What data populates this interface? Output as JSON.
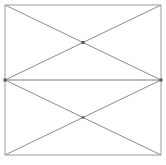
{
  "canvas": {
    "width": 166,
    "height": 165,
    "background_color": "#ffffff",
    "title": ""
  },
  "figure": {
    "name": "crossed-rectangles-diagram",
    "stroke_color": "#8c8c8c",
    "divider_color": "#7a7a7a",
    "border_color": "#9a9a9a",
    "stroke_width": 1,
    "node_color": "#555555"
  },
  "geometry": {
    "outer_rect": {
      "x": 5,
      "y": 5,
      "width": 156,
      "height": 150
    },
    "divider_y": 80,
    "left_x": 5,
    "right_x": 161,
    "top_y": 5,
    "bottom_y": 155,
    "cells": [
      {
        "name": "upper-cell",
        "x": 5,
        "y": 5,
        "width": 156,
        "height": 75,
        "center_x": 83,
        "center_y": 42.5
      },
      {
        "name": "lower-cell",
        "x": 5,
        "y": 80,
        "width": 156,
        "height": 75,
        "center_x": 83,
        "center_y": 117.5
      }
    ],
    "nodes": [
      {
        "name": "node-mid-left",
        "x": 5,
        "y": 80
      },
      {
        "name": "node-mid-right",
        "x": 161,
        "y": 80
      },
      {
        "name": "node-upper-cross",
        "x": 83,
        "y": 42.5
      },
      {
        "name": "node-lower-cross",
        "x": 83,
        "y": 117.5
      }
    ],
    "edges": [
      {
        "name": "border-top",
        "x1": 5,
        "y1": 5,
        "x2": 161,
        "y2": 5
      },
      {
        "name": "border-right",
        "x1": 161,
        "y1": 5,
        "x2": 161,
        "y2": 155
      },
      {
        "name": "border-bottom",
        "x1": 161,
        "y1": 155,
        "x2": 5,
        "y2": 155
      },
      {
        "name": "border-left",
        "x1": 5,
        "y1": 155,
        "x2": 5,
        "y2": 5
      },
      {
        "name": "divider-horizontal",
        "x1": 5,
        "y1": 80,
        "x2": 161,
        "y2": 80
      },
      {
        "name": "upper-diagonal-tl-br",
        "x1": 5,
        "y1": 5,
        "x2": 161,
        "y2": 80
      },
      {
        "name": "upper-diagonal-bl-tr",
        "x1": 5,
        "y1": 80,
        "x2": 161,
        "y2": 5
      },
      {
        "name": "lower-diagonal-tl-br",
        "x1": 5,
        "y1": 80,
        "x2": 161,
        "y2": 155
      },
      {
        "name": "lower-diagonal-bl-tr",
        "x1": 5,
        "y1": 155,
        "x2": 161,
        "y2": 80
      }
    ]
  },
  "labels": {
    "none": ""
  }
}
